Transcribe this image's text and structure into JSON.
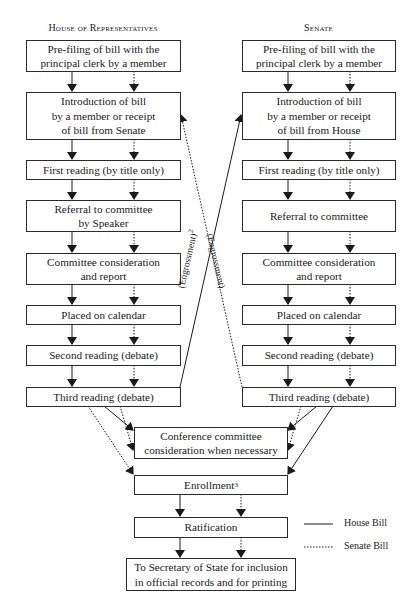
{
  "headers": {
    "house": "House of Representatives",
    "senate": "Senate"
  },
  "house_steps": [
    "Pre-filing of bill with the\nprincipal clerk by a member",
    "Introduction of bill\nby a member or receipt\nof bill from Senate",
    "First reading (by title only)",
    "Referral to committee\nby Speaker",
    "Committee consideration\nand report",
    "Placed on calendar",
    "Second reading (debate)",
    "Third reading (debate)"
  ],
  "senate_steps": [
    "Pre-filing of bill with the\nprincipal clerk by a member",
    "Introduction of bill\nby a member or receipt\nof bill from House",
    "First reading (by title only)",
    "Referral to committee",
    "Committee consideration\nand report",
    "Placed on calendar",
    "Second reading (debate)",
    "Third reading (debate)"
  ],
  "shared_steps": {
    "conference": "Conference committee\nconsideration when necessary",
    "enrollment": "Enrollment",
    "enrollment_footnote": "3",
    "ratification": "Ratification",
    "secretary": "To Secretary of State for inclusion\nin official records and for printing"
  },
  "engrossment_labels": {
    "house_to_senate": "(Engrossment)",
    "house_to_senate_footnote": "2",
    "senate_to_house": "(Engrossment)"
  },
  "legend": {
    "house_bill": "House Bill",
    "senate_bill": "Senate Bill"
  },
  "colors": {
    "line": "#1a1a1a",
    "box_border": "#2a2a2a",
    "background": "#ffffff"
  }
}
